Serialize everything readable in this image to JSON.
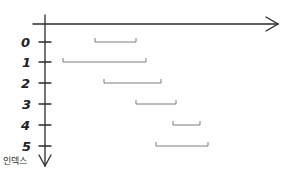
{
  "diagram": {
    "type": "interval-timeline",
    "y_axis_title": "인덱스",
    "colors": {
      "axis": "#2a2a2a",
      "interval": "#7a7a7a",
      "label": "#222222",
      "background": "#ffffff"
    },
    "axes": {
      "origin_x": 45,
      "x_axis_y": 24,
      "x_axis_start": 33,
      "x_axis_end": 278,
      "y_axis_start": 15,
      "y_axis_end": 165
    },
    "rows": [
      {
        "label": "0",
        "y": 42,
        "start_x": 95,
        "end_x": 136
      },
      {
        "label": "1",
        "y": 62,
        "start_x": 63,
        "end_x": 146
      },
      {
        "label": "2",
        "y": 83,
        "start_x": 104,
        "end_x": 161
      },
      {
        "label": "3",
        "y": 104,
        "start_x": 136,
        "end_x": 176
      },
      {
        "label": "4",
        "y": 125,
        "start_x": 173,
        "end_x": 200
      },
      {
        "label": "5",
        "y": 146,
        "start_x": 156,
        "end_x": 208
      }
    ]
  }
}
